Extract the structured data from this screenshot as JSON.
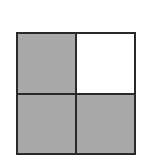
{
  "diagram": {
    "type": "fraction-grid",
    "rows": 2,
    "cols": 2,
    "shaded_count": 3,
    "total_count": 4,
    "colors": {
      "shaded": "#a9a9a9",
      "unshaded": "#ffffff",
      "border": "#2a2a2a"
    },
    "cells": [
      {
        "row": 0,
        "col": 0,
        "shaded": true
      },
      {
        "row": 0,
        "col": 1,
        "shaded": false
      },
      {
        "row": 1,
        "col": 0,
        "shaded": true
      },
      {
        "row": 1,
        "col": 1,
        "shaded": true
      }
    ]
  }
}
